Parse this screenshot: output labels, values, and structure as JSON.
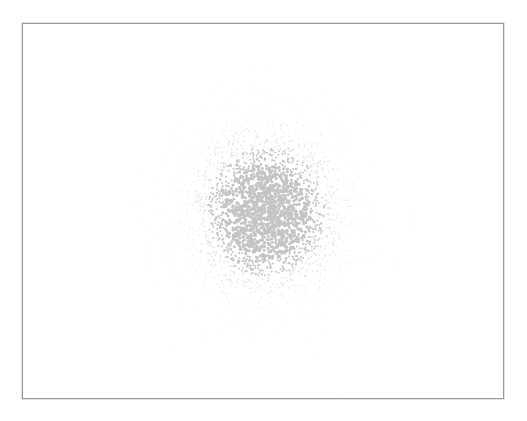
{
  "figure": {
    "caption": "",
    "frame": {
      "left": 22,
      "top": 23,
      "width": 480,
      "height": 374,
      "border_color": "#9a9a9a",
      "background": "#ffffff"
    }
  },
  "chart_data": {
    "type": "scatter",
    "title": "",
    "xlabel": "",
    "ylabel": "",
    "grid": false,
    "legend": null,
    "axes_visible": false,
    "series": [
      {
        "name": "cluster",
        "color": "#c8c8c8",
        "center": {
          "x": 243,
          "y": 188
        },
        "sigma": {
          "x": 40,
          "y": 43
        },
        "point_count": 2600,
        "point_radius": 1.3,
        "core_color": "#c4c4c4",
        "halo_color": "#e2e2e2"
      }
    ]
  }
}
